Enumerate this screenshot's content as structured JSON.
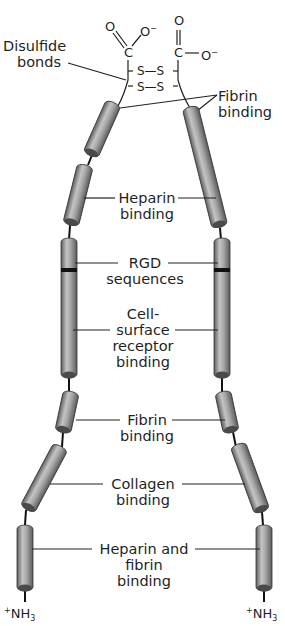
{
  "figure": {
    "colors": {
      "cylinder_light": "#b5b5b5",
      "cylinder_dark": "#6a6a6a",
      "cap": "#4a4a4a",
      "line": "#222222",
      "rgd_band": "#111111"
    }
  },
  "labels": {
    "disulfide": {
      "line1": "Disulfide",
      "line2": "bonds"
    },
    "fibrin_top": {
      "line1": "Fibrin",
      "line2": "binding"
    },
    "heparin": {
      "line1": "Heparin",
      "line2": "binding"
    },
    "rgd": {
      "line1": "RGD",
      "line2": "sequences"
    },
    "cell_surface": {
      "line1": "Cell-",
      "line2": "surface",
      "line3": "receptor",
      "line4": "binding"
    },
    "fibrin_mid": {
      "line1": "Fibrin",
      "line2": "binding"
    },
    "collagen": {
      "line1": "Collagen",
      "line2": "binding"
    },
    "heparin_fibrin": {
      "line1": "Heparin and",
      "line2": "fibrin",
      "line3": "binding"
    }
  },
  "chemistry": {
    "left_carboxyl": {
      "O_double": "O",
      "O_minus": "O",
      "charge": "−",
      "C": "C"
    },
    "right_carboxyl": {
      "O_double": "O",
      "O_minus": "O",
      "charge": "−",
      "C": "C"
    },
    "disulfide_1": "S—S",
    "disulfide_2": "S—S",
    "n_terminus_left": {
      "plus": "+",
      "N": "NH",
      "sub": "3"
    },
    "n_terminus_right": {
      "plus": "+",
      "N": "NH",
      "sub": "3"
    }
  }
}
